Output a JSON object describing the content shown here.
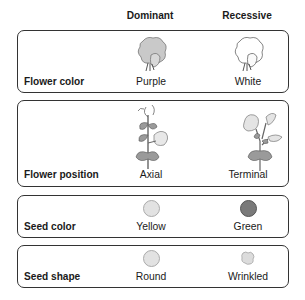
{
  "headers": {
    "dominant": "Dominant",
    "recessive": "Recessive"
  },
  "traits": [
    {
      "name": "Flower color",
      "dominant": {
        "label": "Purple",
        "icon": "purple-flower-icon",
        "color": "#c9c9c9"
      },
      "recessive": {
        "label": "White",
        "icon": "white-flower-icon",
        "color": "#ffffff"
      }
    },
    {
      "name": "Flower position",
      "dominant": {
        "label": "Axial",
        "icon": "axial-flower-plant-icon"
      },
      "recessive": {
        "label": "Terminal",
        "icon": "terminal-flower-plant-icon"
      }
    },
    {
      "name": "Seed color",
      "dominant": {
        "label": "Yellow",
        "icon": "yellow-seed-icon",
        "color": "#e2e2e2"
      },
      "recessive": {
        "label": "Green",
        "icon": "green-seed-icon",
        "color": "#7a7a7a"
      }
    },
    {
      "name": "Seed shape",
      "dominant": {
        "label": "Round",
        "icon": "round-seed-icon",
        "color": "#e2e2e2"
      },
      "recessive": {
        "label": "Wrinkled",
        "icon": "wrinkled-seed-icon",
        "color": "#dcdcdc"
      }
    }
  ]
}
